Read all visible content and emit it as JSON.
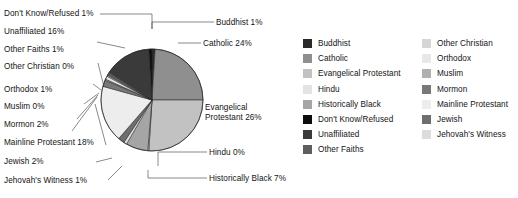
{
  "chart_data": {
    "type": "pie",
    "title": "",
    "subtitle": "",
    "xlabel": "",
    "ylabel": "",
    "legend_position": "right",
    "grid": false,
    "categories": [
      "Buddhist",
      "Catholic",
      "Evangelical Protestant",
      "Hindu",
      "Historically Black",
      "Jehovah's Witness",
      "Jewish",
      "Mainline Protestant",
      "Mormon",
      "Muslim",
      "Orthodox",
      "Other Christian",
      "Other Faiths",
      "Unaffiliated",
      "Don't Know/Refused"
    ],
    "values": [
      1,
      24,
      26,
      0,
      7,
      1,
      2,
      18,
      2,
      0,
      1,
      0,
      1,
      16,
      1
    ],
    "units": "percent",
    "slices": [
      {
        "name": "Buddhist",
        "value": 1,
        "label": "Buddhist 1%",
        "color": "#2a2a2a",
        "start": 0.0,
        "sweep": 3.6
      },
      {
        "name": "Catholic",
        "value": 24,
        "label": "Catholic 24%",
        "color": "#8f8f8f",
        "start": 3.6,
        "sweep": 86.4
      },
      {
        "name": "Evangelical Protestant",
        "value": 26,
        "label": "Evangelical Protestant 26%",
        "color": "#c2c2c2",
        "start": 90.0,
        "sweep": 93.6
      },
      {
        "name": "Hindu",
        "value": 0,
        "label": "Hindu 0%",
        "color": "#e3e3e3",
        "start": 183.6,
        "sweep": 1.2
      },
      {
        "name": "Historically Black",
        "value": 7,
        "label": "Historically Black 7%",
        "color": "#a5a5a5",
        "start": 184.8,
        "sweep": 25.2
      },
      {
        "name": "Jehovah's Witness",
        "value": 1,
        "label": "Jehovah's Witness 1%",
        "color": "#dcdcdc",
        "start": 210.0,
        "sweep": 3.6
      },
      {
        "name": "Jewish",
        "value": 2,
        "label": "Jewish 2%",
        "color": "#6e6e6e",
        "start": 213.6,
        "sweep": 7.2
      },
      {
        "name": "Mainline Protestant",
        "value": 18,
        "label": "Mainline Protestant 18%",
        "color": "#ededed",
        "start": 220.8,
        "sweep": 64.8
      },
      {
        "name": "Mormon",
        "value": 2,
        "label": "Mormon 2%",
        "color": "#787878",
        "start": 285.6,
        "sweep": 7.2
      },
      {
        "name": "Muslim",
        "value": 0,
        "label": "Muslim 0%",
        "color": "#b0b0b0",
        "start": 292.8,
        "sweep": 1.4
      },
      {
        "name": "Orthodox",
        "value": 1,
        "label": "Orthodox 1%",
        "color": "#e8e8e8",
        "start": 294.2,
        "sweep": 3.6
      },
      {
        "name": "Other Christian",
        "value": 0,
        "label": "Other Christian 0%",
        "color": "#d6d6d6",
        "start": 297.8,
        "sweep": 1.4
      },
      {
        "name": "Other Faiths",
        "value": 1,
        "label": "Other Faiths 1%",
        "color": "#5e5e5e",
        "start": 299.2,
        "sweep": 3.6
      },
      {
        "name": "Unaffiliated",
        "value": 16,
        "label": "Unaffiliated 16%",
        "color": "#3a3a3a",
        "start": 302.8,
        "sweep": 53.6
      },
      {
        "name": "Don't Know/Refused",
        "value": 1,
        "label": "Don't Know/Refused 1%",
        "color": "#0d0d0d",
        "start": 356.4,
        "sweep": 3.6
      }
    ]
  },
  "callouts": {
    "left": [
      {
        "text": "Don't Know/Refused 1%"
      },
      {
        "text": "Unaffiliated 16%"
      },
      {
        "text": "Other Faiths 1%"
      },
      {
        "text": "Other Christian 0%"
      },
      {
        "text": "Orthodox 1%"
      },
      {
        "text": "Muslim 0%"
      },
      {
        "text": "Mormon 2%"
      },
      {
        "text": "Mainline Protestant 18%"
      },
      {
        "text": "Jewish 2%"
      },
      {
        "text": "Jehovah's Witness 1%"
      }
    ],
    "right": [
      {
        "text": "Buddhist 1%"
      },
      {
        "text": "Catholic 24%"
      },
      {
        "text": "Evangelical Protestant 26%"
      },
      {
        "text": "Hindu 0%"
      },
      {
        "text": "Historically Black 7%"
      }
    ]
  },
  "legend": {
    "column_1": [
      {
        "label": "Buddhist",
        "color": "#2a2a2a"
      },
      {
        "label": "Catholic",
        "color": "#8f8f8f"
      },
      {
        "label": "Evangelical Protestant",
        "color": "#c2c2c2"
      },
      {
        "label": "Hindu",
        "color": "#e3e3e3"
      },
      {
        "label": "Historically Black",
        "color": "#a5a5a5"
      },
      {
        "label": "Don't Know/Refused",
        "color": "#0d0d0d"
      },
      {
        "label": "Unaffiliated",
        "color": "#3a3a3a"
      },
      {
        "label": "Other Faiths",
        "color": "#5e5e5e"
      }
    ],
    "column_2": [
      {
        "label": "Other Christian",
        "color": "#d6d6d6"
      },
      {
        "label": "Orthodox",
        "color": "#e8e8e8"
      },
      {
        "label": "Muslim",
        "color": "#b0b0b0"
      },
      {
        "label": "Mormon",
        "color": "#787878"
      },
      {
        "label": "Mainline Protestant",
        "color": "#ededed"
      },
      {
        "label": "Jewish",
        "color": "#6e6e6e"
      },
      {
        "label": "Jehovah's Witness",
        "color": "#dcdcdc"
      }
    ]
  }
}
